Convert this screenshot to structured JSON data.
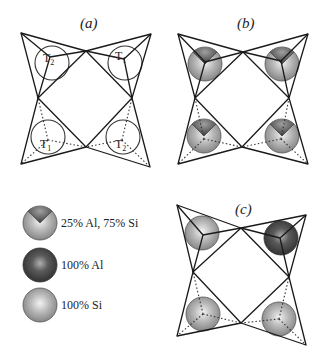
{
  "figure": {
    "panels": [
      {
        "id": "a",
        "label": "(a)",
        "sites": [
          {
            "position": "top-left",
            "type": "T",
            "sub": "2"
          },
          {
            "position": "top-right",
            "type": "T",
            "sub": "1"
          },
          {
            "position": "bottom-left",
            "type": "T",
            "sub": "1"
          },
          {
            "position": "bottom-right",
            "type": "T",
            "sub": "2"
          }
        ]
      },
      {
        "id": "b",
        "label": "(b)",
        "sites": [
          {
            "position": "top-left",
            "occupancy": "25% Al, 75% Si"
          },
          {
            "position": "top-right",
            "occupancy": "25% Al, 75% Si"
          },
          {
            "position": "bottom-left",
            "occupancy": "25% Al, 75% Si"
          },
          {
            "position": "bottom-right",
            "occupancy": "25% Al, 75% Si"
          }
        ]
      },
      {
        "id": "c",
        "label": "(c)",
        "sites": [
          {
            "position": "top-left",
            "occupancy": "100% Si"
          },
          {
            "position": "top-right",
            "occupancy": "100% Al"
          },
          {
            "position": "bottom-left",
            "occupancy": "100% Si"
          },
          {
            "position": "bottom-right",
            "occupancy": "100% Si"
          }
        ]
      }
    ],
    "legend": [
      {
        "key": "mixed",
        "label": "25% Al, 75% Si"
      },
      {
        "key": "al",
        "label": "100% Al"
      },
      {
        "key": "si",
        "label": "100% Si"
      }
    ],
    "colors": {
      "al_sphere": "#4a4a4a",
      "si_sphere": "#a8a8a8",
      "edge": "#1a1a1a"
    }
  }
}
